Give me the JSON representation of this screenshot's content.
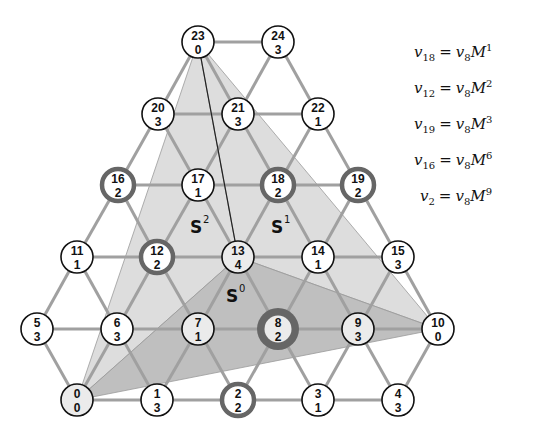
{
  "colors": {
    "edge": "#a0a0a0",
    "region_light": "#d9d9d9",
    "region_dark": "#b4b4b4",
    "node_border": "#111111",
    "highlight_ring": "#666666",
    "node_fill": "#ffffff",
    "node_fill_shaded": "#ebebeb"
  },
  "nodes": [
    {
      "id": "0",
      "value": "0",
      "x": 77,
      "y": 400,
      "shaded": true,
      "highlight": "none"
    },
    {
      "id": "1",
      "value": "3",
      "x": 157,
      "y": 400,
      "shaded": false,
      "highlight": "none"
    },
    {
      "id": "2",
      "value": "2",
      "x": 238,
      "y": 400,
      "shaded": false,
      "highlight": "ring"
    },
    {
      "id": "3",
      "value": "1",
      "x": 318,
      "y": 400,
      "shaded": false,
      "highlight": "none"
    },
    {
      "id": "4",
      "value": "3",
      "x": 398,
      "y": 400,
      "shaded": false,
      "highlight": "none"
    },
    {
      "id": "5",
      "value": "3",
      "x": 37,
      "y": 329,
      "shaded": false,
      "highlight": "none"
    },
    {
      "id": "6",
      "value": "3",
      "x": 117,
      "y": 329,
      "shaded": false,
      "highlight": "none"
    },
    {
      "id": "7",
      "value": "1",
      "x": 198,
      "y": 329,
      "shaded": true,
      "highlight": "none"
    },
    {
      "id": "8",
      "value": "2",
      "x": 278,
      "y": 329,
      "shaded": true,
      "highlight": "thick"
    },
    {
      "id": "9",
      "value": "3",
      "x": 358,
      "y": 329,
      "shaded": true,
      "highlight": "none"
    },
    {
      "id": "10",
      "value": "0",
      "x": 438,
      "y": 329,
      "shaded": false,
      "highlight": "none"
    },
    {
      "id": "11",
      "value": "1",
      "x": 77,
      "y": 257,
      "shaded": false,
      "highlight": "none"
    },
    {
      "id": "12",
      "value": "2",
      "x": 157,
      "y": 257,
      "shaded": false,
      "highlight": "ring"
    },
    {
      "id": "13",
      "value": "4",
      "x": 238,
      "y": 257,
      "shaded": true,
      "highlight": "none"
    },
    {
      "id": "14",
      "value": "1",
      "x": 318,
      "y": 257,
      "shaded": false,
      "highlight": "none"
    },
    {
      "id": "15",
      "value": "3",
      "x": 398,
      "y": 257,
      "shaded": false,
      "highlight": "none"
    },
    {
      "id": "16",
      "value": "2",
      "x": 118,
      "y": 185,
      "shaded": false,
      "highlight": "ring"
    },
    {
      "id": "17",
      "value": "1",
      "x": 198,
      "y": 185,
      "shaded": false,
      "highlight": "none"
    },
    {
      "id": "18",
      "value": "2",
      "x": 278,
      "y": 185,
      "shaded": false,
      "highlight": "ring"
    },
    {
      "id": "19",
      "value": "2",
      "x": 358,
      "y": 185,
      "shaded": false,
      "highlight": "ring"
    },
    {
      "id": "20",
      "value": "3",
      "x": 158,
      "y": 114,
      "shaded": false,
      "highlight": "none"
    },
    {
      "id": "21",
      "value": "3",
      "x": 238,
      "y": 114,
      "shaded": false,
      "highlight": "none"
    },
    {
      "id": "22",
      "value": "1",
      "x": 318,
      "y": 114,
      "shaded": false,
      "highlight": "none"
    },
    {
      "id": "23",
      "value": "0",
      "x": 198,
      "y": 42,
      "shaded": false,
      "highlight": "none"
    },
    {
      "id": "24",
      "value": "3",
      "x": 278,
      "y": 42,
      "shaded": false,
      "highlight": "none"
    }
  ],
  "edges": [
    [
      "0",
      "1"
    ],
    [
      "1",
      "2"
    ],
    [
      "2",
      "3"
    ],
    [
      "3",
      "4"
    ],
    [
      "5",
      "6"
    ],
    [
      "6",
      "7"
    ],
    [
      "7",
      "8"
    ],
    [
      "8",
      "9"
    ],
    [
      "9",
      "10"
    ],
    [
      "11",
      "12"
    ],
    [
      "12",
      "13"
    ],
    [
      "13",
      "14"
    ],
    [
      "14",
      "15"
    ],
    [
      "16",
      "17"
    ],
    [
      "17",
      "18"
    ],
    [
      "18",
      "19"
    ],
    [
      "20",
      "21"
    ],
    [
      "21",
      "22"
    ],
    [
      "23",
      "24"
    ],
    [
      "0",
      "5"
    ],
    [
      "0",
      "6"
    ],
    [
      "1",
      "6"
    ],
    [
      "1",
      "7"
    ],
    [
      "2",
      "7"
    ],
    [
      "2",
      "8"
    ],
    [
      "3",
      "8"
    ],
    [
      "3",
      "9"
    ],
    [
      "4",
      "9"
    ],
    [
      "4",
      "10"
    ],
    [
      "5",
      "11"
    ],
    [
      "6",
      "11"
    ],
    [
      "6",
      "12"
    ],
    [
      "7",
      "12"
    ],
    [
      "7",
      "13"
    ],
    [
      "8",
      "13"
    ],
    [
      "8",
      "14"
    ],
    [
      "9",
      "14"
    ],
    [
      "9",
      "15"
    ],
    [
      "10",
      "15"
    ],
    [
      "11",
      "16"
    ],
    [
      "12",
      "16"
    ],
    [
      "12",
      "17"
    ],
    [
      "13",
      "17"
    ],
    [
      "13",
      "18"
    ],
    [
      "14",
      "18"
    ],
    [
      "14",
      "19"
    ],
    [
      "15",
      "19"
    ],
    [
      "16",
      "20"
    ],
    [
      "17",
      "20"
    ],
    [
      "17",
      "21"
    ],
    [
      "18",
      "21"
    ],
    [
      "18",
      "22"
    ],
    [
      "19",
      "22"
    ],
    [
      "20",
      "23"
    ],
    [
      "21",
      "23"
    ],
    [
      "21",
      "24"
    ],
    [
      "22",
      "24"
    ]
  ],
  "regions": [
    {
      "name": "S",
      "sup": "2",
      "vertices": [
        "23",
        "0",
        "13"
      ],
      "shade": "light",
      "label_x": 190,
      "label_y": 233
    },
    {
      "name": "S",
      "sup": "1",
      "vertices": [
        "23",
        "13",
        "10"
      ],
      "shade": "light",
      "label_x": 271,
      "label_y": 233
    },
    {
      "name": "S",
      "sup": "0",
      "vertices": [
        "0",
        "13",
        "10"
      ],
      "shade": "dark",
      "label_x": 226,
      "label_y": 302
    }
  ],
  "connector_line": {
    "from": "23",
    "to": "13"
  },
  "equations": [
    {
      "lhs_var": "v",
      "lhs_sub": "18",
      "rhs_var": "v",
      "rhs_sub": "8",
      "matrix": "M",
      "power": "1"
    },
    {
      "lhs_var": "v",
      "lhs_sub": "12",
      "rhs_var": "v",
      "rhs_sub": "8",
      "matrix": "M",
      "power": "2"
    },
    {
      "lhs_var": "v",
      "lhs_sub": "19",
      "rhs_var": "v",
      "rhs_sub": "8",
      "matrix": "M",
      "power": "3"
    },
    {
      "lhs_var": "v",
      "lhs_sub": "16",
      "rhs_var": "v",
      "rhs_sub": "8",
      "matrix": "M",
      "power": "6"
    },
    {
      "lhs_var": "v",
      "lhs_sub": "2",
      "rhs_var": "v",
      "rhs_sub": "8",
      "matrix": "M",
      "power": "9"
    }
  ],
  "equals_sign": "="
}
